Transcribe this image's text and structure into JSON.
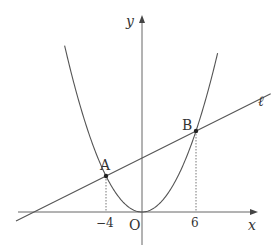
{
  "diagram": {
    "type": "coordinate-graph",
    "origin_px": [
      142,
      212
    ],
    "unit_px": 9,
    "axes": {
      "x_label": "x",
      "y_label": "y",
      "origin_label": "O"
    },
    "curves": [
      {
        "name": "parabola",
        "equation": "y = x^2/4"
      }
    ],
    "lines": [
      {
        "name": "ℓ",
        "label": "ℓ",
        "slope": 0.5,
        "intercept": 6
      }
    ],
    "points": [
      {
        "label": "A",
        "x": -4,
        "y": 4
      },
      {
        "label": "B",
        "x": 6,
        "y": 9
      }
    ],
    "tick_labels": [
      {
        "x": -4,
        "text": "−4"
      },
      {
        "x": 6,
        "text": "6"
      }
    ],
    "colors": {
      "stroke": "#444444",
      "text": "#333333"
    }
  }
}
